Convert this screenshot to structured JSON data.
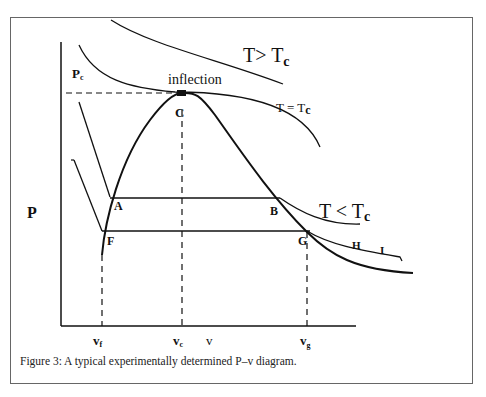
{
  "figure": {
    "caption": "Figure 3: A typical experimentally determined P–v diagram."
  },
  "axes": {
    "y_label": "P",
    "x_label": "v",
    "y_marks": [
      "P_c"
    ],
    "x_marks": [
      "v_f",
      "v_c",
      "v_g"
    ]
  },
  "labels": {
    "pc_main": "P",
    "pc_sub": "c",
    "vf_main": "v",
    "vf_sub": "f",
    "vc_main": "v",
    "vc_sub": "c",
    "vg_main": "v",
    "vg_sub": "g",
    "v_axis": "v",
    "p_axis": "P",
    "inflection": "inflection",
    "point_c": "C",
    "point_a": "A",
    "point_b": "B",
    "point_f": "F",
    "point_g": "G",
    "point_h": "H",
    "point_i": "I",
    "t_gt_tc_main": "T> T",
    "t_gt_tc_sub": "c",
    "t_eq_tc_main": "T = T",
    "t_eq_tc_sub": "c",
    "t_lt_tc_main": "T < T",
    "t_lt_tc_sub": "c"
  },
  "diagram": {
    "type": "P-v phase diagram",
    "curves": [
      "saturation dome (liquid & vapor lines meeting at critical point C)",
      "isotherm T > Tc",
      "critical isotherm T = Tc with inflection at C",
      "isotherm T < Tc through A–B",
      "isotherm through F–G–H–I"
    ],
    "points": [
      "A",
      "B",
      "C",
      "F",
      "G",
      "H",
      "I"
    ]
  }
}
